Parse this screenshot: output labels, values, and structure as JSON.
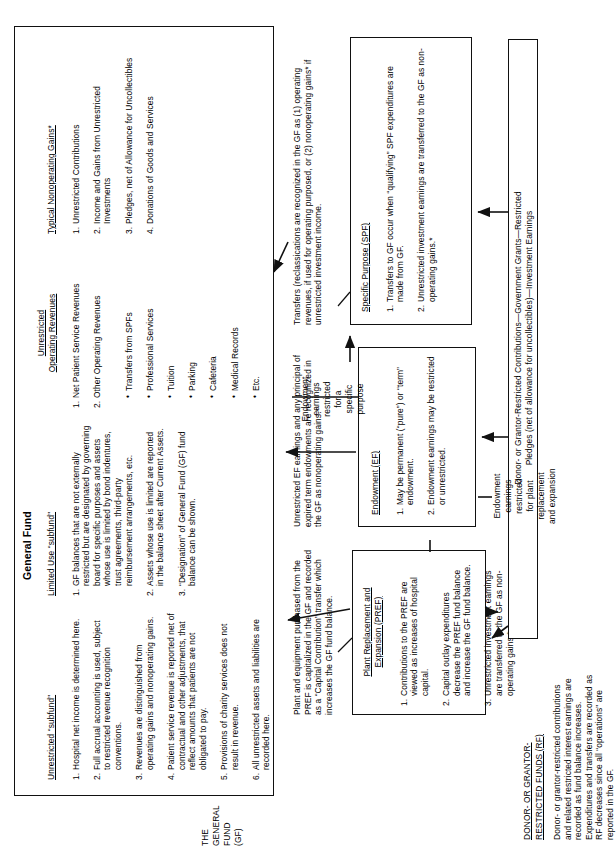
{
  "diagram": {
    "general_fund": {
      "title": "General Fund",
      "side_label": "THE\nGENERAL\nFUND\n(GF)",
      "columns": [
        {
          "heading": "Unrestricted “subfund”",
          "items": [
            "Hospital net income is determined here.",
            "Full accrual accounting is used, subject to restricted revenue recognition conventions.",
            "Revenues are distinguished from operating gains and nonoperating gains.",
            "Patient service revenue is reported net of contractual and other adjustments, that reflect amounts that patients are not obligated to pay.",
            "Provisions of charity services does not result in revenue.",
            "All unrestricted assets and liabilities are recorded here."
          ]
        },
        {
          "heading": "Limited Use “subfund”",
          "items": [
            "GF balances that are not externally restricted but are designated by governing board for specific purposes and assets whose use is limited by bond indentures, trust agreements, third-party reimbursement arrangements, etc.",
            "Assets whose use is limited are reported in the balance sheet after Current Assets.",
            "“Designation” of General Fund (GF) fund balance can be shown."
          ]
        },
        {
          "heading": "Unrestricted\nOperating Revenues",
          "items": [
            "Net Patient Service Revenues",
            "Other Operating Revenues"
          ],
          "subitems": [
            "Transfers from SPFs",
            "Professional Services",
            "Tuition",
            "Parking",
            "Cafeteria",
            "Medical Records",
            "Etc."
          ]
        },
        {
          "heading": "Typical Nonoperating Gains*",
          "items": [
            "Unrestricted Contributions",
            "Income and Gains from Unrestricted Investments",
            "Pledges, net of Allowance for Uncollectibles",
            "Donations of Goods and Services"
          ]
        }
      ]
    },
    "specific_purpose": {
      "title": "Specific Purpose (SPF)",
      "items": [
        "Transfers to GF occur when “qualifying” SPF expenditures are made from GF.",
        "Unrestricted investment earnings are transferred to the GF as non-operating gains.*"
      ]
    },
    "endowment": {
      "title": "Endowment (EF)",
      "items": [
        "May be permanent (“pure”) or “term” endowment.",
        "Endowment earnings may be restricted or unrestricted."
      ]
    },
    "pref": {
      "title": "Plant Replacement and\nExpansion (PREF)",
      "items": [
        "Contributions to the PREF are viewed as increases of hospital capital.",
        "Capital outlay expenditures decrease the PREF fund balance and increase the GF fund balance.",
        "Unrestricted investment earnings are transferred to the GF as non-operating gains.*"
      ]
    },
    "restricted_funds": {
      "title": "DONOR- OR GRANTOR-\nRESTRICTED FUNDS (RF)",
      "body": "Donor- or grantor-restricted contributions and related restricted interest earnings are recorded as fund balance increases. Expenditures and transfers are recorded as RF decreases since all “operations” are reported in the GF."
    },
    "annotations": {
      "transfers_note": "Transfers (reclassications are recognized in the GF as (1) operating revenues, if used for operating purposed, or (2) nonoperating gains* if unrestricted investment income.",
      "unrestricted_ef_note": "Unrestricted EF earnings and any principal of expired term endowments are recognized in the GF as nonoperating gains.*",
      "plant_note": "Plant and equipment purchased from the PREF is capitalized in the GF and recorded as a “Capital Contribution” transfer which increases the GF fund balance.",
      "ef_to_spf": "Endowment\nearnings\nrestricted\nfor a\nspecific\npurpose",
      "ef_to_pref": "Endowment\nearnings\nrestricted\nfor plant\nreplacement\nand expansion",
      "inflow_label": "Donor- or Grantor-Restricted Contributions—Government Grants—Restricted\nPledges (net of allowance for uncollectibles)—Investment Earnings"
    }
  }
}
